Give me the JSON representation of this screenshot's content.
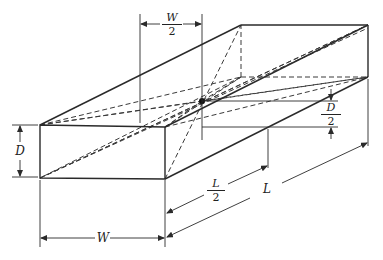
{
  "diagram": {
    "labels": {
      "width": "W",
      "depth": "D",
      "length": "L",
      "half_width": {
        "num": "W",
        "den": "2"
      },
      "half_depth": {
        "num": "D",
        "den": "2"
      },
      "half_length": {
        "num": "L",
        "den": "2"
      }
    },
    "colors": {
      "line": "#2a2a2a",
      "background": "#ffffff"
    }
  }
}
